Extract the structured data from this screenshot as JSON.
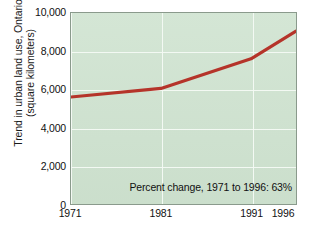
{
  "chart_data": {
    "type": "line",
    "title": "",
    "xlabel": "",
    "ylabel": "Trend in urban land use, Ontario (square kilometers)",
    "ylabel_lines": [
      "Trend in urban land use, Ontario",
      "(square kilometers)"
    ],
    "categories": [
      "1971",
      "1981",
      "1991",
      "1996"
    ],
    "x": [
      1971,
      1981,
      1991,
      1996
    ],
    "values": [
      5600,
      6050,
      7600,
      9050
    ],
    "series": [
      {
        "name": "Urban land use",
        "values": [
          5600,
          6050,
          7600,
          9050
        ],
        "color": "#b5342a"
      }
    ],
    "ylim": [
      0,
      10000
    ],
    "xlim": [
      1971,
      1996
    ],
    "ytick_labels": [
      "10,000",
      "8,000",
      "6,000",
      "4,000",
      "2,000",
      "0"
    ],
    "ytick_values": [
      10000,
      8000,
      6000,
      4000,
      2000,
      0
    ],
    "xtick_labels": [
      "1971",
      "1981",
      "1991",
      "1996"
    ],
    "xtick_values": [
      1971,
      1981,
      1991,
      1996
    ],
    "grid": true,
    "grid_color": "#f4faf4",
    "legend": "none",
    "plot_background": "#cfe3d0",
    "annotations": [
      {
        "text": "Percent change, 1971 to 1996: 63%",
        "position": "bottom-right-inside-plot"
      }
    ]
  },
  "annotation": {
    "percent_change_note": "Percent change, 1971 to 1996: 63%"
  },
  "axes": {
    "y": {
      "title_line1": "Trend in urban land use, Ontario",
      "title_line2": "(square kilometers)",
      "ticks": [
        {
          "label": "10,000",
          "value": 10000
        },
        {
          "label": "8,000",
          "value": 8000
        },
        {
          "label": "6,000",
          "value": 6000
        },
        {
          "label": "4,000",
          "value": 4000
        },
        {
          "label": "2,000",
          "value": 2000
        },
        {
          "label": "0",
          "value": 0
        }
      ]
    },
    "x": {
      "ticks": [
        {
          "label": "1971",
          "value": 1971
        },
        {
          "label": "1981",
          "value": 1981
        },
        {
          "label": "1991",
          "value": 1991
        },
        {
          "label": "1996",
          "value": 1996
        }
      ]
    }
  },
  "colors": {
    "line": "#b5342a",
    "plot_background": "#cfe3d0",
    "gridline": "#f4faf4",
    "plot_border": "#8a9a8c",
    "text": "#111111",
    "page_background": "#ffffff"
  }
}
